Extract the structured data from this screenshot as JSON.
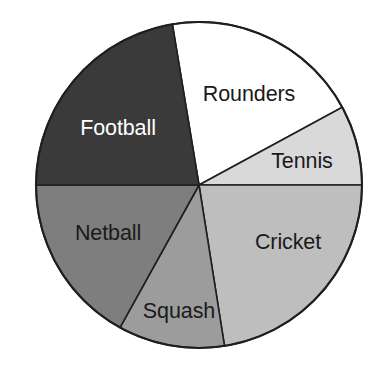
{
  "chart_data": {
    "type": "pie",
    "title": "",
    "subtitle": "",
    "xlabel": "",
    "ylabel": "",
    "legend_position": "none",
    "grid": false,
    "labels_inside": true,
    "center": {
      "x": 199,
      "y": 185
    },
    "radius": 163,
    "start_angle_deg": -99.4,
    "categories": [
      "Rounders",
      "Tennis",
      "Cricket",
      "Squash",
      "Netball",
      "Football"
    ],
    "values": [
      70.9,
      28.5,
      81.0,
      38.0,
      61.0,
      80.6
    ],
    "units": "degrees",
    "slices": [
      {
        "label": "Rounders",
        "angle_deg": 70.9,
        "start_deg": -99.4,
        "end_deg": -28.5,
        "color": "#ffffff",
        "text_color": "#1a1a1a",
        "label_x": 249,
        "label_y": 95
      },
      {
        "label": "Tennis",
        "angle_deg": 28.5,
        "start_deg": -28.5,
        "end_deg": 0,
        "color": "#d9d9d9",
        "text_color": "#1a1a1a",
        "label_x": 302,
        "label_y": 162
      },
      {
        "label": "Cricket",
        "angle_deg": 81.0,
        "start_deg": 0,
        "end_deg": 81.0,
        "color": "#bebebe",
        "text_color": "#1a1a1a",
        "label_x": 288,
        "label_y": 243
      },
      {
        "label": "Squash",
        "angle_deg": 38.0,
        "start_deg": 81.0,
        "end_deg": 119.0,
        "color": "#9c9c9c",
        "text_color": "#1a1a1a",
        "label_x": 179,
        "label_y": 312
      },
      {
        "label": "Netball",
        "angle_deg": 61.0,
        "start_deg": 119.0,
        "end_deg": 180.0,
        "color": "#7e7e7e",
        "text_color": "#1a1a1a",
        "label_x": 108,
        "label_y": 234
      },
      {
        "label": "Football",
        "angle_deg": 80.6,
        "start_deg": 180.0,
        "end_deg": 260.6,
        "color": "#3a3a3a",
        "text_color": "#ffffff",
        "label_x": 118,
        "label_y": 129
      }
    ],
    "colors": {
      "rounders": "#ffffff",
      "tennis": "#d9d9d9",
      "cricket": "#bebebe",
      "squash": "#9c9c9c",
      "netball": "#7e7e7e",
      "football": "#3a3a3a",
      "outline": "#1f1f1f",
      "background": "#ffffff"
    }
  }
}
